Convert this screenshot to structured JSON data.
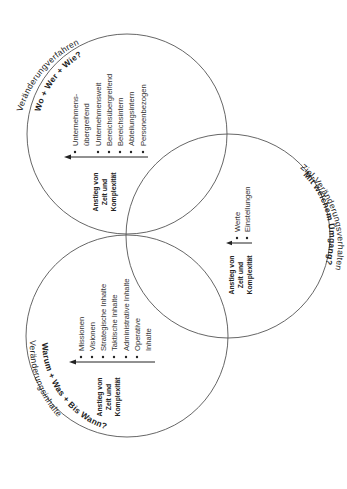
{
  "diagram": {
    "orientation": "rotated -90deg (text reads bottom-to-top)",
    "circles": [
      {
        "id": "verfahren",
        "title": "Veränderungverfahren",
        "subtitle": "Wo + Wer + Wie?",
        "items": [
          "Unternehmens-",
          "übergreifend",
          "Unternehmensweit",
          "Bereichsübergreifend",
          "Bereichsintern",
          "Abteilungsintern",
          "Personenbezogen"
        ],
        "axis_label": [
          "Anstieg von",
          "Zeit und",
          "Komplexität"
        ]
      },
      {
        "id": "verhalten",
        "title": "Mit welchem Umgang?",
        "subtitle": "Ziel-Veränderungsverhalten",
        "items": [
          "Werte",
          "Einstellungen"
        ],
        "axis_label": [
          "Anstieg von",
          "Zeit und",
          "Komplexität"
        ]
      },
      {
        "id": "inhalte",
        "title": "Veränderungsinhalte",
        "subtitle": "Warum + Was + Bis Wann?",
        "items": [
          "Missionen",
          "Visionen",
          "Strategische Inhalte",
          "Taktische Inhalte",
          "Administrative Inhalte",
          "Operative",
          "Inhalte"
        ],
        "axis_label": [
          "Anstieg von",
          "Zeit und",
          "Komplexität"
        ]
      }
    ]
  }
}
